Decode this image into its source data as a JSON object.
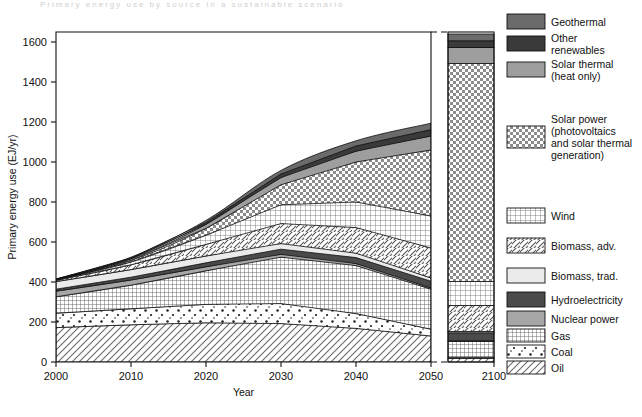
{
  "figure": {
    "faint_header": "Primary energy use by source in a sustainable scenario",
    "xlabel": "Year",
    "ylabel": "Primary energy use (EJ/yr)"
  },
  "chart_data": {
    "type": "area",
    "title": "",
    "xlabel": "Year",
    "ylabel": "Primary energy use (EJ/yr)",
    "xlim": [
      2000,
      2050
    ],
    "ylim": [
      0,
      1650
    ],
    "ytick_values": [
      0,
      200,
      400,
      600,
      800,
      1000,
      1200,
      1400,
      1600
    ],
    "ytick_labels": [
      "0",
      "200",
      "400",
      "600",
      "800",
      "1000",
      "1200",
      "1400",
      "1600"
    ],
    "xtick_values": [
      2000,
      2010,
      2020,
      2030,
      2040,
      2050
    ],
    "xtick_labels": [
      "2000",
      "2010",
      "2020",
      "2030",
      "2040",
      "2050"
    ],
    "break_panel": {
      "tick_value": 2100,
      "tick_label": "2100",
      "total": 1640
    },
    "grid": false,
    "legend_position": "right",
    "stack_order_bottom_to_top": [
      "Oil",
      "Coal",
      "Gas",
      "Nuclear power",
      "Hydroelectricity",
      "Biomass, trad.",
      "Biomass, adv.",
      "Wind",
      "Solar power",
      "Solar thermal (heat only)",
      "Other renewables",
      "Geothermal"
    ],
    "x": [
      2000,
      2010,
      2020,
      2030,
      2040,
      2050
    ],
    "series": [
      {
        "name": "Oil",
        "values": [
          172,
          186,
          196,
          192,
          168,
          130
        ]
      },
      {
        "name": "Coal",
        "values": [
          72,
          80,
          92,
          100,
          74,
          34
        ]
      },
      {
        "name": "Gas",
        "values": [
          82,
          118,
          168,
          232,
          240,
          200
        ]
      },
      {
        "name": "Nuclear power",
        "values": [
          28,
          26,
          20,
          14,
          10,
          6
        ]
      },
      {
        "name": "Hydroelectricity",
        "values": [
          10,
          14,
          20,
          26,
          30,
          34
        ]
      },
      {
        "name": "Biomass, trad.",
        "values": [
          38,
          38,
          34,
          28,
          22,
          16
        ]
      },
      {
        "name": "Biomass, adv.",
        "values": [
          6,
          24,
          58,
          100,
          128,
          150
        ]
      },
      {
        "name": "Wind",
        "values": [
          2,
          14,
          46,
          94,
          128,
          160
        ]
      },
      {
        "name": "Solar power",
        "values": [
          1,
          8,
          34,
          100,
          200,
          330
        ]
      },
      {
        "name": "Solar thermal (heat only)",
        "values": [
          2,
          8,
          20,
          36,
          54,
          70
        ]
      },
      {
        "name": "Other renewables",
        "values": [
          1,
          4,
          10,
          18,
          26,
          32
        ]
      },
      {
        "name": "Geothermal",
        "values": [
          1,
          4,
          10,
          18,
          26,
          32
        ]
      }
    ],
    "totals": [
      415,
      524,
      708,
      958,
      1106,
      1194
    ],
    "panel_2100": [
      {
        "name": "Oil",
        "value": 18
      },
      {
        "name": "Coal",
        "value": 6
      },
      {
        "name": "Gas",
        "value": 78
      },
      {
        "name": "Nuclear power",
        "value": 4
      },
      {
        "name": "Hydroelectricity",
        "value": 40
      },
      {
        "name": "Biomass, trad.",
        "value": 6
      },
      {
        "name": "Biomass, adv.",
        "value": 130
      },
      {
        "name": "Wind",
        "value": 120
      },
      {
        "name": "Solar power",
        "value": 1090
      },
      {
        "name": "Solar thermal (heat only)",
        "value": 80
      },
      {
        "name": "Other renewables",
        "value": 34
      },
      {
        "name": "Geothermal",
        "value": 34
      }
    ]
  },
  "legend": {
    "items": [
      {
        "label": "Geothermal",
        "pattern": "solid-dark-gray",
        "color": "#6b6b6b"
      },
      {
        "label": "Other\nrenewables",
        "pattern": "solid-darker",
        "color": "#444444"
      },
      {
        "label": "Solar thermal\n(heat only)",
        "pattern": "solid-mid-gray",
        "color": "#9a9a9a"
      },
      {
        "label": "Solar power\n(photovoltaics\nand solar thermal\ngeneration)",
        "pattern": "checkerboard",
        "color": "#8f8f8f"
      },
      {
        "label": "Wind",
        "pattern": "fine-grid",
        "color": "#777777"
      },
      {
        "label": "Biomass, adv.",
        "pattern": "diagonal-hatch-back",
        "color": "#555555"
      },
      {
        "label": "Biomass, trad.",
        "pattern": "very-light",
        "color": "#e4e4e4"
      },
      {
        "label": "Hydroelectricity",
        "pattern": "solid-dark",
        "color": "#4f4f4f"
      },
      {
        "label": "Nuclear power",
        "pattern": "solid-gray",
        "color": "#a6a6a6"
      },
      {
        "label": "Gas",
        "pattern": "dense-grid",
        "color": "#707070"
      },
      {
        "label": "Coal",
        "pattern": "dots",
        "color": "#2b2b2b"
      },
      {
        "label": "Oil",
        "pattern": "diagonal-hatch",
        "color": "#6a6a6a"
      }
    ]
  }
}
